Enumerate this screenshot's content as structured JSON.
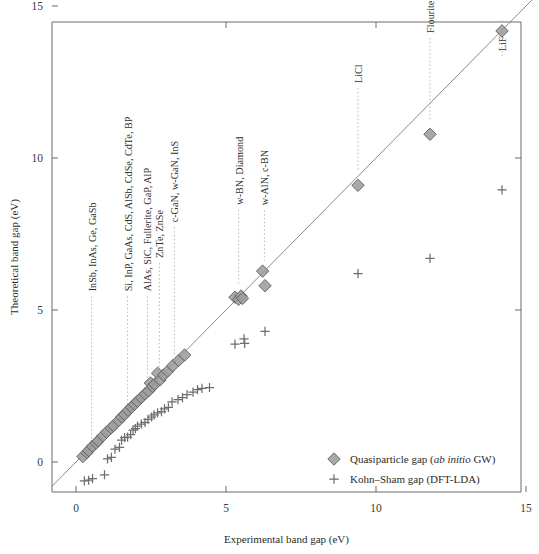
{
  "chart_data": {
    "type": "scatter",
    "title": "",
    "xlabel": "Experimental band gap (eV)",
    "ylabel": "Theoretical band gap (eV)",
    "xlim": [
      -0.8,
      15.3
    ],
    "ylim": [
      -1.05,
      15.35
    ],
    "xticks": [
      0,
      5,
      10,
      15
    ],
    "yticks": [
      0,
      5,
      10,
      15
    ],
    "xticklabels": [
      "0",
      "5",
      "10",
      "15"
    ],
    "yticklabels": [
      "0",
      "5",
      "10",
      "15"
    ],
    "grid": false,
    "legend_position": "lower-right",
    "reference_line": {
      "name": "y = x identity line",
      "from": [
        -0.8,
        -0.8
      ],
      "to": [
        15.3,
        15.3
      ]
    },
    "series": [
      {
        "name": "Quasiparticle gap (ab initio GW)",
        "marker": "diamond",
        "color": "#9d9d9d",
        "edge_color": "#5d5d5d",
        "points": [
          [
            0.23,
            0.18
          ],
          [
            0.36,
            0.31
          ],
          [
            0.42,
            0.38
          ],
          [
            0.55,
            0.52
          ],
          [
            0.67,
            0.62
          ],
          [
            0.74,
            0.7
          ],
          [
            0.9,
            0.86
          ],
          [
            1.02,
            0.98
          ],
          [
            1.17,
            1.12
          ],
          [
            1.25,
            1.2
          ],
          [
            1.42,
            1.36
          ],
          [
            1.52,
            1.48
          ],
          [
            1.62,
            1.56
          ],
          [
            1.74,
            1.7
          ],
          [
            1.85,
            1.8
          ],
          [
            1.95,
            1.9
          ],
          [
            2.05,
            2.0
          ],
          [
            2.18,
            2.12
          ],
          [
            2.3,
            2.24
          ],
          [
            2.42,
            2.34
          ],
          [
            2.48,
            2.6
          ],
          [
            2.55,
            2.48
          ],
          [
            2.62,
            2.56
          ],
          [
            2.72,
            2.92
          ],
          [
            2.8,
            2.7
          ],
          [
            2.92,
            2.86
          ],
          [
            3.05,
            2.98
          ],
          [
            3.22,
            3.16
          ],
          [
            3.42,
            3.34
          ],
          [
            3.62,
            3.52
          ],
          [
            5.3,
            5.42
          ],
          [
            5.42,
            5.35
          ],
          [
            5.5,
            5.46
          ],
          [
            5.55,
            5.38
          ],
          [
            6.22,
            6.28
          ],
          [
            6.3,
            5.8
          ],
          [
            9.4,
            9.1
          ],
          [
            11.8,
            10.78
          ],
          [
            14.2,
            14.18
          ]
        ]
      },
      {
        "name": "Kohn–Sham gap (DFT-LDA)",
        "marker": "plus",
        "color": "#6e6e6e",
        "points": [
          [
            0.28,
            -0.62
          ],
          [
            0.42,
            -0.6
          ],
          [
            0.55,
            -0.55
          ],
          [
            0.95,
            -0.42
          ],
          [
            1.05,
            0.1
          ],
          [
            1.18,
            0.15
          ],
          [
            1.3,
            0.42
          ],
          [
            1.45,
            0.48
          ],
          [
            1.52,
            0.72
          ],
          [
            1.62,
            0.8
          ],
          [
            1.72,
            0.82
          ],
          [
            1.82,
            0.9
          ],
          [
            1.9,
            1.05
          ],
          [
            1.98,
            1.1
          ],
          [
            2.05,
            1.18
          ],
          [
            2.18,
            1.25
          ],
          [
            2.3,
            1.3
          ],
          [
            2.4,
            1.4
          ],
          [
            2.52,
            1.48
          ],
          [
            2.6,
            1.55
          ],
          [
            2.72,
            1.62
          ],
          [
            2.85,
            1.66
          ],
          [
            2.95,
            1.75
          ],
          [
            3.08,
            1.8
          ],
          [
            3.2,
            1.98
          ],
          [
            3.4,
            2.05
          ],
          [
            3.55,
            2.12
          ],
          [
            3.7,
            2.22
          ],
          [
            3.9,
            2.3
          ],
          [
            4.05,
            2.38
          ],
          [
            4.2,
            2.42
          ],
          [
            4.45,
            2.45
          ],
          [
            5.3,
            3.88
          ],
          [
            5.6,
            4.05
          ],
          [
            5.62,
            3.9
          ],
          [
            6.3,
            4.3
          ],
          [
            9.4,
            6.2
          ],
          [
            11.8,
            6.7
          ],
          [
            14.2,
            8.95
          ]
        ]
      }
    ],
    "annotations": [
      {
        "label": "InSb, InAs, Ge, GaSb",
        "x": 0.52,
        "leader_top_y": 5.45,
        "leader_bottom_y": 0.55
      },
      {
        "label": "Si, InP, GaAs, CdS, AlSb, CdSe, CdTe, BP",
        "x": 1.72,
        "leader_top_y": 5.45,
        "leader_bottom_y": 1.9
      },
      {
        "label": "AlAs, SiC, Fullerite, GaP, AlP",
        "x": 2.38,
        "leader_top_y": 5.45,
        "leader_bottom_y": 2.62
      },
      {
        "label": "ZnTe, ZnSe",
        "x": 2.78,
        "leader_top_y": 6.55,
        "leader_bottom_y": 3.05
      },
      {
        "label": "c-GaN, w-GaN, InS",
        "x": 3.28,
        "leader_top_y": 7.72,
        "leader_bottom_y": 3.52
      },
      {
        "label": "w-BN, Diamond",
        "x": 5.42,
        "leader_top_y": 8.3,
        "leader_bottom_y": 5.8
      },
      {
        "label": "w-AlN, c-BN",
        "x": 6.28,
        "leader_top_y": 8.28,
        "leader_bottom_y": 6.62
      },
      {
        "label": "LiCl",
        "x": 9.4,
        "leader_top_y": 12.3,
        "leader_bottom_y": 9.55
      },
      {
        "label": "Flourite",
        "x": 11.8,
        "leader_top_y": 13.95,
        "leader_bottom_y": 11.25
      },
      {
        "label": "LiF",
        "x": 14.2,
        "leader_top_y": 13.35,
        "leader_bottom_y": 14.6
      }
    ],
    "legend": [
      {
        "marker": "diamond",
        "text_plain": "Quasiparticle gap (ab initio GW)",
        "pre": "Quasiparticle gap (",
        "em": "ab initio",
        "post": " GW)"
      },
      {
        "marker": "plus",
        "text_plain": "Kohn–Sham gap (DFT-LDA)",
        "pre": "Kohn–Sham gap (DFT-LDA)",
        "em": "",
        "post": ""
      }
    ]
  }
}
